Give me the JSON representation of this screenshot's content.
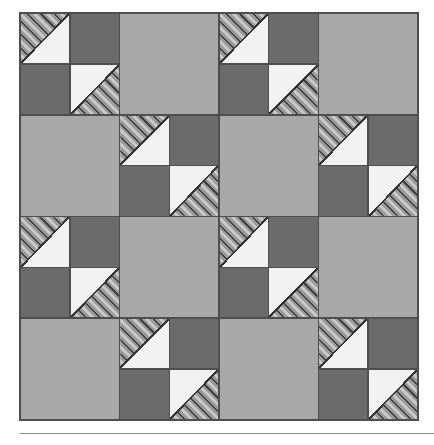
{
  "figure": {
    "kind": "quilt-diagram",
    "caption": ""
  },
  "palette": {
    "background": "#ffffff",
    "light_gray": "#a8a8a8",
    "dark_gray": "#6b6b6b",
    "white_patch": "#f2f2f2",
    "hatch_base": "#9a9a9a",
    "hatch_line": "#3f3f3f",
    "seam_line": "#333333",
    "border": "#4e4e4e",
    "rule": "#8a8a8a"
  },
  "layout": {
    "grid_rows": 4,
    "grid_cols": 4,
    "block_px": 100,
    "quilt_left": 19,
    "quilt_top": 12,
    "quilt_width": 400,
    "quilt_height": 409
  },
  "block_types": {
    "plain": "Solid light gray square",
    "pinwheel": "Four-patch: two half-square-triangle units (hatched + white) on the diagonal, two solid dark gray squares on the opposite diagonal"
  },
  "quarter_types": {
    "hst_upper_left": "Half-square triangle, hatched fabric in the upper-left half, white in the lower-right half",
    "hst_lower_right": "Half-square triangle, white in the upper-left half, hatched fabric in the lower-right half",
    "solid_dark": "Solid dark gray quarter square"
  },
  "blocks": [
    [
      {
        "type": "pinwheel",
        "name": "block-r1c1"
      },
      {
        "type": "plain",
        "name": "block-r1c2"
      },
      {
        "type": "pinwheel",
        "name": "block-r1c3"
      },
      {
        "type": "plain",
        "name": "block-r1c4"
      }
    ],
    [
      {
        "type": "plain",
        "name": "block-r2c1"
      },
      {
        "type": "pinwheel",
        "name": "block-r2c2"
      },
      {
        "type": "plain",
        "name": "block-r2c3"
      },
      {
        "type": "pinwheel",
        "name": "block-r2c4"
      }
    ],
    [
      {
        "type": "pinwheel",
        "name": "block-r3c1"
      },
      {
        "type": "plain",
        "name": "block-r3c2"
      },
      {
        "type": "pinwheel",
        "name": "block-r3c3"
      },
      {
        "type": "plain",
        "name": "block-r3c4"
      }
    ],
    [
      {
        "type": "plain",
        "name": "block-r4c1"
      },
      {
        "type": "pinwheel",
        "name": "block-r4c2"
      },
      {
        "type": "plain",
        "name": "block-r4c3"
      },
      {
        "type": "pinwheel",
        "name": "block-r4c4"
      }
    ]
  ],
  "pinwheel_quarters": [
    "hst_upper_left",
    "solid_dark",
    "solid_dark",
    "hst_lower_right"
  ]
}
